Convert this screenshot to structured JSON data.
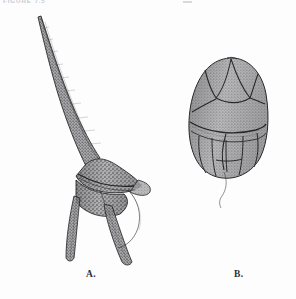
{
  "page": {
    "background_color": "#fdfdfd",
    "ink_color": "#2b2b2d",
    "fill_tone": "#9a9a9c"
  },
  "header": {
    "running_head": "FIGURE 7.5",
    "running_head_visible_fragment": "FIGURE 7.5",
    "clipped_at_top": true,
    "mark_color": "#c9c9cd"
  },
  "figure": {
    "kind": "scientific-illustration-plate",
    "technique": "stipple-and-line ink drawing",
    "panel_count": 2
  },
  "panels": [
    {
      "id": "A",
      "label": "A.",
      "label_x": 86,
      "label_y": 269,
      "description": "elongate horned dinoflagellate with long apical horn and two antapical horns",
      "features": [
        "apical horn",
        "epitheca",
        "cingulum",
        "sulcus",
        "left antapical horn",
        "right antapical horn",
        "trailing flagellum"
      ],
      "bbox": [
        22,
        14,
        152,
        262
      ]
    },
    {
      "id": "B",
      "label": "B.",
      "label_x": 234,
      "label_y": 269,
      "description": "rounded ovoid dinoflagellate showing thecal plate sutures and girdle",
      "features": [
        "epitheca plates",
        "apical pore plate",
        "cingulum",
        "hypotheca plates",
        "sulcus",
        "trailing flagellum"
      ],
      "bbox": [
        186,
        56,
        270,
        200
      ]
    }
  ],
  "colors": {
    "ink": "#2b2b2d",
    "mid_tone": "#8f8f91",
    "light_tone": "#c4c4c6",
    "paper": "#fdfdfd",
    "label_text": "#2e2e30",
    "caption_text": "#b9b9bd"
  }
}
